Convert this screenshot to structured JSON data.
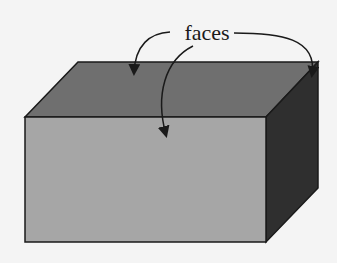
{
  "diagram": {
    "label": "faces",
    "colors": {
      "background": "#f4f4f4",
      "top_face": "#6f6f6f",
      "front_face": "#a6a6a6",
      "right_face": "#2f2f2f",
      "outline": "#1a1a1a"
    }
  }
}
